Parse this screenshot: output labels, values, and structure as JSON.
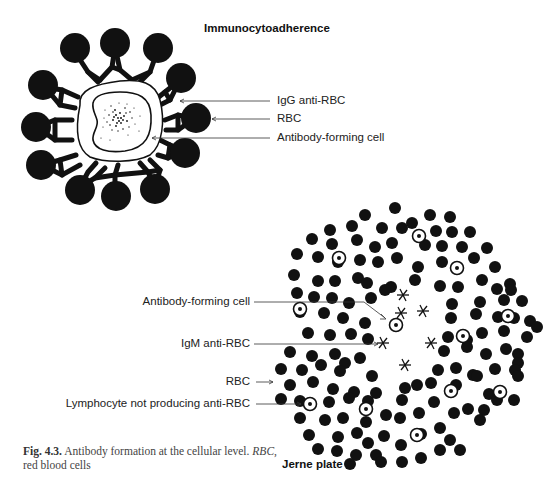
{
  "figure": {
    "caption_label": "Fig. 4.3.",
    "caption_text": " Antibody formation at the cellular level. ",
    "caption_abbr": "RBC",
    "caption_text2": ", red blood cells"
  },
  "panels": {
    "immunocytoadherence": {
      "title": "Immunocytoadherence",
      "labels": {
        "igg": "IgG anti-RBC",
        "rbc": "RBC",
        "afc": "Antibody-forming cell"
      }
    },
    "jerne": {
      "title": "Jerne plate",
      "labels": {
        "afc": "Antibody-forming cell",
        "igm": "IgM anti-RBC",
        "rbc": "RBC",
        "lymphocyte": "Lymphocyte not producing anti-RBC"
      }
    }
  },
  "colors": {
    "ink": "#111111",
    "text": "#222222",
    "caption": "#444444",
    "background": "#ffffff"
  }
}
